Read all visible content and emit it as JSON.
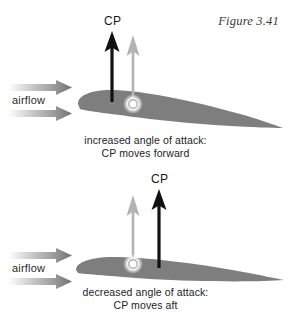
{
  "figure": {
    "caption_label": "Figure 3.41",
    "colors": {
      "airfoil_gray": "#7e7e7e",
      "arrow_black": "#111114",
      "arrow_gray": "#b3b3b3",
      "airflow_gray": "#8a8a8a",
      "background": "#ffffff",
      "text": "#232326"
    }
  },
  "panels": [
    {
      "id": "increased-angle-of-attack",
      "airflow_label": "airflow",
      "cp_label": "CP",
      "caption_line1": "increased angle of attack:",
      "caption_line2": "CP moves forward",
      "black_arrow": {
        "label": "CP",
        "x": 112,
        "tip_y": 32,
        "base_y": 102
      },
      "gray_arrow": {
        "x": 133,
        "tip_y": 36,
        "base_y": 106,
        "has_dot": true
      }
    },
    {
      "id": "decreased-angle-of-attack",
      "airflow_label": "airflow",
      "cp_label": "CP",
      "caption_line1": "decreased angle of attack:",
      "caption_line2": "CP moves aft",
      "black_arrow": {
        "label": "CP",
        "x": 159,
        "tip_y": 30,
        "base_y": 108
      },
      "gray_arrow": {
        "x": 133,
        "tip_y": 36,
        "base_y": 104,
        "has_dot": true
      }
    }
  ]
}
